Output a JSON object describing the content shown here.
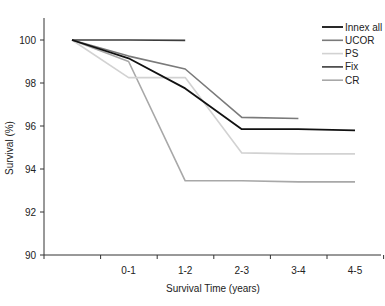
{
  "chart_data": {
    "type": "line",
    "title": "",
    "xlabel": "Survival Time (years)",
    "ylabel": "Survival (%)",
    "categories": [
      "",
      "0-1",
      "1-2",
      "2-3",
      "3-4",
      "4-5"
    ],
    "ylim": [
      90,
      101
    ],
    "yticks": [
      90,
      92,
      94,
      96,
      98,
      100
    ],
    "grid": false,
    "legend_position": "top-right",
    "series": [
      {
        "name": "Innex all",
        "color": "#111111",
        "width": 1.8,
        "values": [
          100,
          99.15,
          97.75,
          95.85,
          95.85,
          95.8
        ]
      },
      {
        "name": "UCOR",
        "color": "#7a7a7a",
        "width": 1.6,
        "values": [
          100,
          99.25,
          98.65,
          96.4,
          96.35,
          null
        ]
      },
      {
        "name": "PS",
        "color": "#d2d2d2",
        "width": 1.6,
        "values": [
          100,
          98.25,
          98.25,
          94.75,
          94.7,
          94.7
        ]
      },
      {
        "name": "Fix",
        "color": "#3c3c3c",
        "width": 1.6,
        "values": [
          100,
          100,
          99.98,
          null,
          null,
          null
        ]
      },
      {
        "name": "CR",
        "color": "#a8a8a8",
        "width": 1.6,
        "values": [
          100,
          99.0,
          93.45,
          93.45,
          93.4,
          93.4
        ]
      }
    ]
  }
}
